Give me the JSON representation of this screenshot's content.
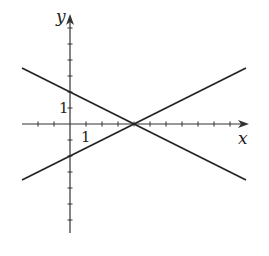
{
  "chart_data": {
    "type": "line",
    "title": "",
    "xlabel": "x",
    "ylabel": "y",
    "xlim": [
      -3,
      11
    ],
    "ylim": [
      -7,
      7
    ],
    "grid": false,
    "x_ticks": [
      -2,
      -1,
      0,
      1,
      2,
      3,
      4,
      5,
      6,
      7,
      8,
      9,
      10
    ],
    "y_ticks": [
      -6,
      -5,
      -4,
      -3,
      -2,
      -1,
      0,
      1,
      2,
      3,
      4,
      5,
      6
    ],
    "tick_labels": {
      "x": "1",
      "y": "1"
    },
    "series": [
      {
        "name": "decreasing-line",
        "equation": "y = -x/2 + 2",
        "x": [
          -3,
          11
        ],
        "y": [
          3.5,
          -3.5
        ]
      },
      {
        "name": "increasing-line",
        "equation": "y = x/2 - 2",
        "x": [
          -3,
          11
        ],
        "y": [
          -3.5,
          3.5
        ]
      }
    ],
    "intersection": [
      4,
      0
    ],
    "colors": {
      "line": "#222222",
      "axis": "#333333"
    }
  }
}
